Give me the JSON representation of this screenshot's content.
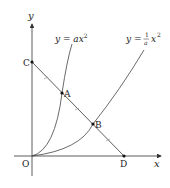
{
  "diagram": {
    "axes": {
      "x_label": "x",
      "y_label": "y",
      "origin_label": "O"
    },
    "curves": [
      {
        "id": "steep",
        "label_prefix": "y = a",
        "label_var": "x",
        "label_exp": "2"
      },
      {
        "id": "shallow",
        "label_prefix": "y = ",
        "frac_num": "1",
        "frac_den": "a",
        "label_var": "x",
        "label_exp": "2"
      }
    ],
    "points": {
      "C": "C",
      "A": "A",
      "B": "B",
      "D": "D"
    },
    "colors": {
      "line": "#333333",
      "curve": "#444444",
      "tick": "#888888",
      "text": "#222222"
    }
  }
}
